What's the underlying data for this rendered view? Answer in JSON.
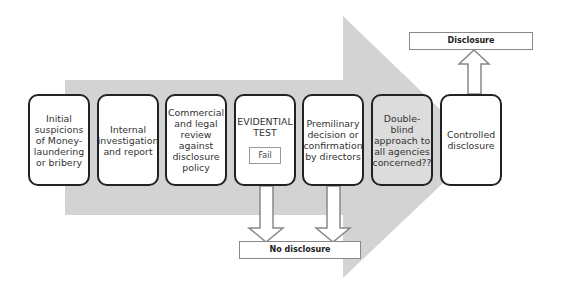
{
  "diagram": {
    "steps": [
      {
        "label": "Initial suspicions of Money-laundering or bribery"
      },
      {
        "label": "Internal investigation and report"
      },
      {
        "label": "Commercial and legal review against disclosure policy"
      },
      {
        "label": "EVIDENTIAL TEST",
        "badge": "Fail"
      },
      {
        "label": "Premilinary decision or confirmation by directors"
      },
      {
        "label": "Double-blind approach to all agencies concerned??",
        "highlighted": true
      },
      {
        "label": "Controlled disclosure"
      }
    ],
    "outcomes": {
      "disclosure": "Disclosure",
      "no_disclosure": "No disclosure"
    },
    "colors": {
      "arrow": "#d0d0d0",
      "border": "#222222",
      "highlight": "#dcdcdc"
    }
  }
}
